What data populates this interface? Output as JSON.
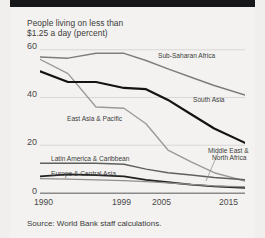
{
  "header": {
    "bar_color": "#16181a"
  },
  "title": {
    "line1": "People living on less than",
    "line2": "$1.25 a day (percent)"
  },
  "source": {
    "text": "Source: World Bank staff calculations."
  },
  "axis": {
    "y_ticks": [
      "60",
      "40",
      "20",
      "0"
    ],
    "x_ticks": [
      "1990",
      "1999",
      "2005",
      "2015"
    ]
  },
  "labels": {
    "sub_saharan": "Sub-Saharan Africa",
    "south_asia": "South Asia",
    "east_asia": "East Asia & Pacific",
    "latin_america": "Latin America & Caribbean",
    "europe_central_asia": "Europe & Central Asia",
    "middle_east_1": "Middle East &",
    "middle_east_2": "North Africa"
  },
  "chart_data": {
    "type": "line",
    "title": "People living on less than $1.25 a day (percent)",
    "xlabel": "",
    "ylabel": "percent",
    "x": [
      1990,
      1993,
      1996,
      1999,
      2002,
      2005,
      2008,
      2011,
      2015
    ],
    "xticks": [
      1990,
      1999,
      2005,
      2015
    ],
    "ylim": [
      0,
      62
    ],
    "yticks": [
      0,
      20,
      40,
      60
    ],
    "grid": "horizontal",
    "legend": "inline-annotations",
    "source": "Source: World Bank staff calculations.",
    "series": [
      {
        "name": "Sub-Saharan Africa",
        "color": "#7d7d7d",
        "width": 1.5,
        "values": [
          57.0,
          56.5,
          58.5,
          58.5,
          55.5,
          52.0,
          48.5,
          45.0,
          41.0
        ]
      },
      {
        "name": "East Asia & Pacific",
        "color": "#9a9a9a",
        "width": 1.4,
        "values": [
          56.0,
          50.0,
          36.0,
          35.5,
          29.0,
          18.0,
          13.0,
          8.5,
          5.0
        ]
      },
      {
        "name": "South Asia",
        "color": "#131313",
        "width": 2.2,
        "values": [
          51.0,
          46.5,
          46.5,
          44.0,
          43.5,
          39.0,
          33.0,
          27.0,
          21.0
        ]
      },
      {
        "name": "Latin America & Caribbean",
        "color": "#5f5f5f",
        "width": 1.5,
        "values": [
          12.5,
          12.5,
          12.5,
          12.0,
          10.0,
          8.5,
          7.5,
          6.5,
          5.5
        ]
      },
      {
        "name": "Europe & Central Asia",
        "color": "#222222",
        "width": 1.8,
        "values": [
          7.0,
          7.8,
          7.5,
          7.0,
          5.5,
          4.5,
          3.5,
          2.8,
          2.2
        ]
      },
      {
        "name": "Middle East & North Africa",
        "color": "#8e8e8e",
        "width": 1.3,
        "values": [
          6.0,
          5.8,
          5.5,
          5.2,
          4.8,
          4.2,
          3.6,
          3.0,
          2.6
        ]
      }
    ]
  }
}
